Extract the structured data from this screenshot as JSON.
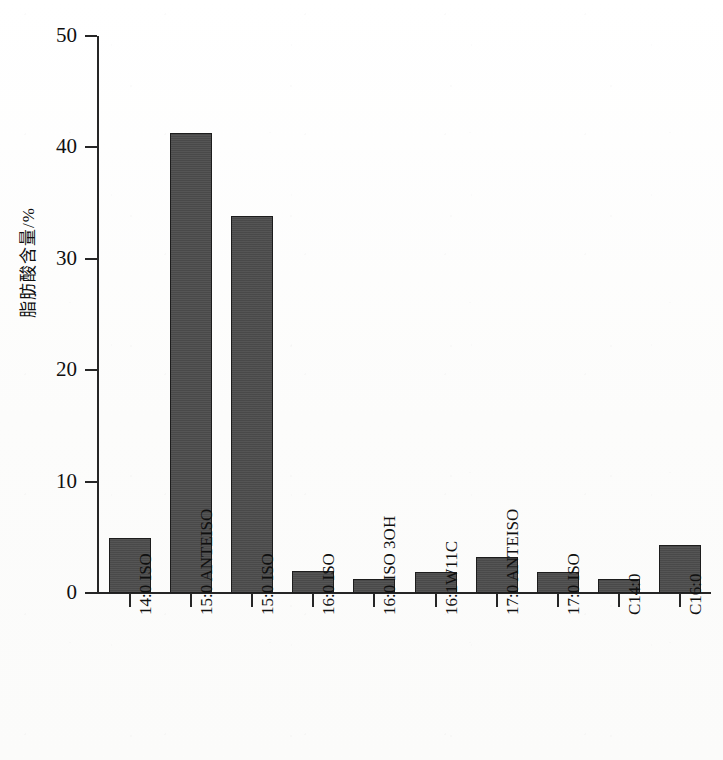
{
  "chart_data": {
    "type": "bar",
    "title": "",
    "xlabel": "",
    "ylabel": "脂肪酸含量/%",
    "ylim": [
      0,
      50
    ],
    "yticks": [
      0,
      10,
      20,
      30,
      40,
      50
    ],
    "ytick_labels": [
      "0",
      "10",
      "20",
      "30",
      "40",
      "50"
    ],
    "grid": false,
    "legend": false,
    "bar_color": "#4d4d4d",
    "bar_edge_color": "#1d1d1d",
    "axis_color": "#262626",
    "background_color": "#fdfdfd",
    "categories": [
      "14:0 ISO",
      "15:0 ANTEISO",
      "15:0 ISO",
      "16:0 ISO",
      "16:0 ISO 3OH",
      "16:1W11C",
      "17:0 ANTEISO",
      "17:0 ISO",
      "C14:0",
      "C16:0"
    ],
    "values": [
      4.9,
      41.3,
      33.8,
      2.0,
      1.3,
      1.9,
      3.2,
      1.9,
      1.3,
      4.3
    ]
  }
}
